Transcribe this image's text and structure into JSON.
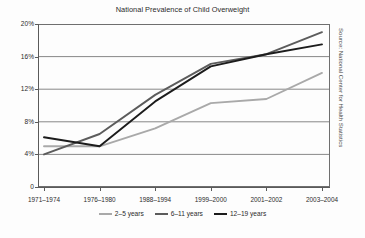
{
  "chart_data": {
    "type": "line",
    "title": "National Prevalence of Child Overweight",
    "xlabel": "",
    "ylabel": "",
    "ylim": [
      0,
      20
    ],
    "yticks": [
      0,
      4,
      8,
      12,
      16,
      20
    ],
    "ytick_labels": [
      "0",
      "4%",
      "8%",
      "12%",
      "16%",
      "20%"
    ],
    "grid": true,
    "legend_position": "bottom",
    "categories": [
      "1971–1974",
      "1976–1980",
      "1988–1994",
      "1999–2000",
      "2001–2002",
      "2003–2004"
    ],
    "series": [
      {
        "name": "2–5 years",
        "color": "#a9a9a9",
        "values": [
          5.0,
          5.0,
          7.2,
          10.3,
          10.8,
          14.0
        ]
      },
      {
        "name": "6–11 years",
        "color": "#5c5c5c",
        "values": [
          4.0,
          6.5,
          11.3,
          15.1,
          16.3,
          19.0
        ]
      },
      {
        "name": "12–19 years",
        "color": "#1c1c1c",
        "values": [
          6.1,
          5.0,
          10.5,
          14.8,
          16.3,
          17.5
        ]
      }
    ],
    "source_note": "Source: National Center for Health Statistics"
  },
  "legend": {
    "items": [
      {
        "label": "2–5 years"
      },
      {
        "label": "6–11 years"
      },
      {
        "label": "12–19 years"
      }
    ]
  }
}
